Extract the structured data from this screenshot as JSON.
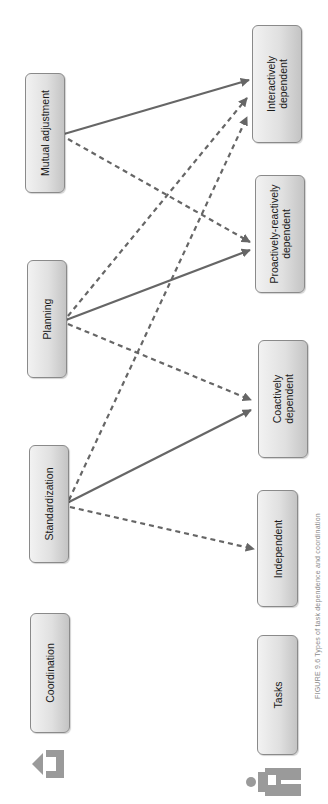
{
  "figure": {
    "caption": "FIGURE 9.6  Types of task dependence and coordination",
    "line_color": "#666666",
    "box_fill_light": "#f2f2f2",
    "box_fill_dark": "#c4c4c4",
    "box_border": "#8a8a8a"
  },
  "coordination": {
    "header": "Coordination",
    "icon": "building-arrow-icon",
    "mechanisms": [
      {
        "label": "Standardization"
      },
      {
        "label": "Planning"
      },
      {
        "label": "Mutual adjustment"
      }
    ]
  },
  "tasks": {
    "header": "Tasks",
    "icon": "person-with-task-icon",
    "dependence_types": [
      {
        "label_line1": "Independent",
        "label_line2": ""
      },
      {
        "label_line1": "Coactively",
        "label_line2": "dependent"
      },
      {
        "label_line1": "Proactively-reactively",
        "label_line2": "dependent"
      },
      {
        "label_line1": "Interactively",
        "label_line2": "dependent"
      }
    ]
  },
  "connections": [
    {
      "from": "Standardization",
      "to": "Independent",
      "style": "dashed"
    },
    {
      "from": "Standardization",
      "to": "Coactively dependent",
      "style": "solid"
    },
    {
      "from": "Standardization",
      "to": "Interactively dependent",
      "style": "dashed"
    },
    {
      "from": "Planning",
      "to": "Coactively dependent",
      "style": "dashed"
    },
    {
      "from": "Planning",
      "to": "Proactively-reactively dependent",
      "style": "solid"
    },
    {
      "from": "Planning",
      "to": "Interactively dependent",
      "style": "dashed"
    },
    {
      "from": "Mutual adjustment",
      "to": "Proactively-reactively dependent",
      "style": "dashed"
    },
    {
      "from": "Mutual adjustment",
      "to": "Interactively dependent",
      "style": "solid"
    }
  ]
}
